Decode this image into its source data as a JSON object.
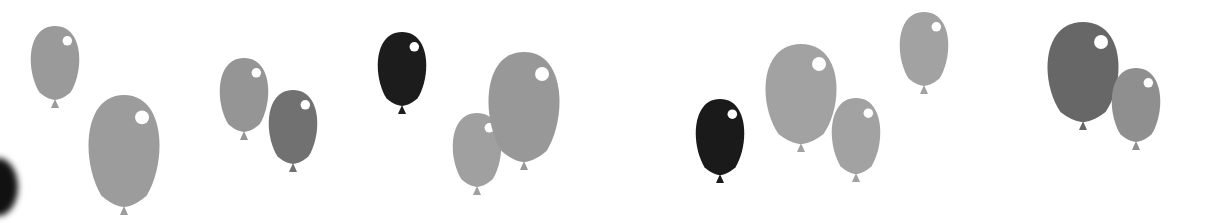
{
  "scene": {
    "description": "Decorative row of grayscale balloons on white background",
    "background": "#ffffff",
    "balloons": [
      {
        "cx": 55,
        "top": 26,
        "w": 56,
        "h": 74,
        "color": "#9a9a9a"
      },
      {
        "cx": 124,
        "top": 95,
        "w": 82,
        "h": 112,
        "color": "#9c9c9c"
      },
      {
        "cx": 244,
        "top": 58,
        "w": 56,
        "h": 74,
        "color": "#959595"
      },
      {
        "cx": 293,
        "top": 90,
        "w": 56,
        "h": 74,
        "color": "#717171"
      },
      {
        "cx": 402,
        "top": 32,
        "w": 56,
        "h": 74,
        "color": "#1c1c1c"
      },
      {
        "cx": 477,
        "top": 113,
        "w": 56,
        "h": 74,
        "color": "#a0a0a0"
      },
      {
        "cx": 524,
        "top": 52,
        "w": 82,
        "h": 110,
        "color": "#989898"
      },
      {
        "cx": 720,
        "top": 99,
        "w": 56,
        "h": 76,
        "color": "#1a1a1a"
      },
      {
        "cx": 801,
        "top": 44,
        "w": 82,
        "h": 100,
        "color": "#a2a2a2"
      },
      {
        "cx": 856,
        "top": 98,
        "w": 56,
        "h": 76,
        "color": "#a2a2a2"
      },
      {
        "cx": 924,
        "top": 12,
        "w": 56,
        "h": 74,
        "color": "#a2a2a2"
      },
      {
        "cx": 1083,
        "top": 22,
        "w": 82,
        "h": 100,
        "color": "#676767"
      },
      {
        "cx": 1136,
        "top": 68,
        "w": 56,
        "h": 74,
        "color": "#8f8f8f"
      }
    ]
  }
}
